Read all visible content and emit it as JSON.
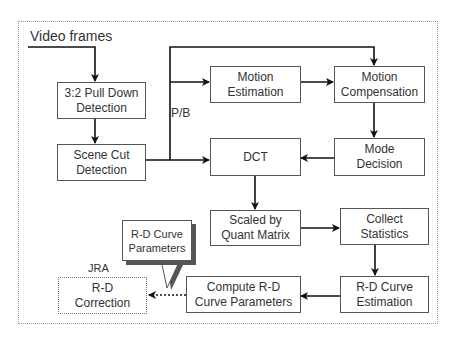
{
  "diagram": {
    "input_label": "Video frames",
    "pb_label": "P/B",
    "jra_label": "JRA",
    "nodes": {
      "pulldown": {
        "line1": "3:2 Pull Down",
        "line2": "Detection"
      },
      "scenecut": {
        "line1": "Scene Cut",
        "line2": "Detection"
      },
      "motion_est": {
        "line1": "Motion",
        "line2": "Estimation"
      },
      "motion_comp": {
        "line1": "Motion",
        "line2": "Compensation"
      },
      "dct": {
        "line1": "DCT"
      },
      "mode_decision": {
        "line1": "Mode",
        "line2": "Decision"
      },
      "scaled_quant": {
        "line1": "Scaled by",
        "line2": "Quant Matrix"
      },
      "collect_stats": {
        "line1": "Collect",
        "line2": "Statistics"
      },
      "rd_estimation": {
        "line1": "R-D Curve",
        "line2": "Estimation"
      },
      "compute_rd": {
        "line1": "Compute R-D",
        "line2": "Curve Parameters"
      },
      "rd_correction": {
        "line1": "R-D",
        "line2": "Correction"
      }
    },
    "callout": {
      "line1": "R-D Curve",
      "line2": "Parameters"
    },
    "edges": [
      [
        "Video frames",
        "3:2 Pull Down Detection"
      ],
      [
        "3:2 Pull Down Detection",
        "Scene Cut Detection"
      ],
      [
        "Scene Cut Detection",
        "DCT"
      ],
      [
        "Scene Cut Detection",
        "Motion Estimation"
      ],
      [
        "Scene Cut Detection",
        "Motion Compensation"
      ],
      [
        "Motion Estimation",
        "Motion Compensation"
      ],
      [
        "Motion Compensation",
        "Mode Decision"
      ],
      [
        "Mode Decision",
        "DCT"
      ],
      [
        "DCT",
        "Scaled by Quant Matrix"
      ],
      [
        "Scaled by Quant Matrix",
        "Collect Statistics"
      ],
      [
        "Collect Statistics",
        "R-D Curve Estimation"
      ],
      [
        "R-D Curve Estimation",
        "Compute R-D Curve Parameters"
      ],
      [
        "Compute R-D Curve Parameters",
        "R-D Correction"
      ]
    ]
  }
}
